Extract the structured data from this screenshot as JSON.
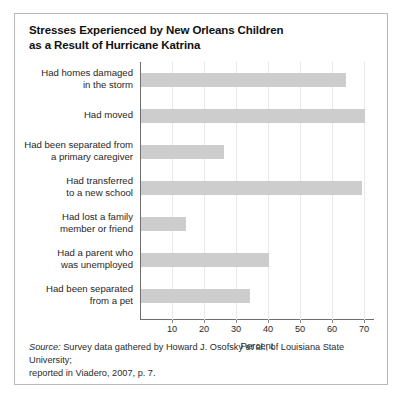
{
  "chart_data": {
    "type": "bar",
    "orientation": "horizontal",
    "title": "Stresses Experienced by New Orleans Children as a Result of Hurricane Katrina",
    "title_lines": [
      "Stresses Experienced by New Orleans Children",
      "as a Result of Hurricane Katrina"
    ],
    "categories": [
      "Had homes damaged in the storm",
      "Had moved",
      "Had been separated from a primary caregiver",
      "Had transferred to a new school",
      "Had lost a family member or friend",
      "Had a parent who was unemployed",
      "Had been separated from a pet"
    ],
    "category_lines": [
      [
        "Had homes damaged",
        "in the storm"
      ],
      [
        "Had moved"
      ],
      [
        "Had been separated from",
        "a primary caregiver"
      ],
      [
        "Had transferred",
        "to a new school"
      ],
      [
        "Had lost a family",
        "member or friend"
      ],
      [
        "Had a parent who",
        "was unemployed"
      ],
      [
        "Had been separated",
        "from a pet"
      ]
    ],
    "values": [
      64,
      70,
      26,
      69,
      14,
      40,
      34
    ],
    "xlabel": "Percent",
    "ylabel": "",
    "xlim": [
      0,
      73
    ],
    "xticks": [
      10,
      20,
      30,
      40,
      50,
      60,
      70
    ],
    "xtick_labels": [
      "10",
      "20",
      "30",
      "40",
      "50",
      "60",
      "70"
    ],
    "grid": "vertical",
    "legend": "none",
    "bar_color": "#cdcdcd"
  },
  "source": {
    "label": "Source:",
    "line1": " Survey data gathered by Howard J. Osofsky et al., of Louisiana State University;",
    "line2": "reported in Viadero, 2007, p. 7."
  },
  "colors": {
    "bar": "#cdcdcd",
    "grid": "#e7e7e7",
    "axis": "#6e6e6e",
    "frame": "#b8b8b8",
    "text": "#1a1a1a"
  }
}
